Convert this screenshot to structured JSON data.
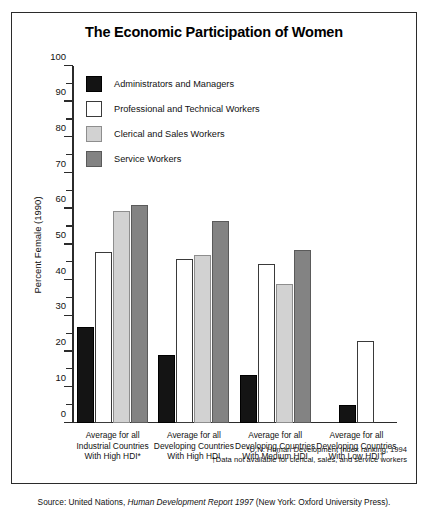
{
  "title": "The Economic Participation of Women",
  "legend": [
    {
      "label": "Administrators and Managers",
      "color": "#141414"
    },
    {
      "label": "Professional and Technical Workers",
      "color": "#ffffff"
    },
    {
      "label": "Clerical and Sales Workers",
      "color": "#d2d2d2"
    },
    {
      "label": "Service Workers",
      "color": "#838383"
    }
  ],
  "notes": {
    "asterisk": "*U.N. Human Development Index ranking, 1994",
    "dagger": "†Data not available for clerical, sales, and service workers"
  },
  "source": {
    "prefix": "Source: United Nations, ",
    "italic": "Human Development Report 1997",
    "suffix": " (New York: Oxford University Press)."
  },
  "chart_data": {
    "type": "bar",
    "title": "The Economic Participation of Women",
    "xlabel": "",
    "ylabel": "Percent Female (1990)",
    "ylim": [
      0,
      100
    ],
    "yticks": [
      0,
      10,
      20,
      30,
      40,
      50,
      60,
      70,
      80,
      90,
      100
    ],
    "ytick_labels": [
      "0",
      "10",
      "20",
      "30",
      "40",
      "50",
      "60",
      "70",
      "80",
      "90",
      "100"
    ],
    "minor_ticks": true,
    "grid": false,
    "legend_position": "upper-left-inside",
    "categories": [
      "Average for all\nIndustrial Countries\nWith High HDI*",
      "Average for all\nDeveloping Countries\nWith High HDI",
      "Average for all\nDeveloping Countries\nWith Medium HDI",
      "Average for all\nDeveloping Countries\nWith Low HDI†"
    ],
    "category_lines": [
      [
        "Average for all",
        "Industrial Countries",
        "With High HDI*"
      ],
      [
        "Average for all",
        "Developing Countries",
        "With High HDI"
      ],
      [
        "Average for all",
        "Developing Countries",
        "With Medium HDI"
      ],
      [
        "Average for all",
        "Developing Countries",
        "With Low HDI†"
      ]
    ],
    "series": [
      {
        "name": "Administrators and Managers",
        "color": "#141414",
        "values": [
          27,
          19,
          13.5,
          5
        ]
      },
      {
        "name": "Professional and Technical Workers",
        "color": "#ffffff",
        "values": [
          48,
          46,
          44.5,
          23
        ]
      },
      {
        "name": "Clerical and Sales Workers",
        "color": "#d2d2d2",
        "values": [
          59.5,
          47,
          39,
          null
        ]
      },
      {
        "name": "Service Workers",
        "color": "#838383",
        "values": [
          61,
          56.5,
          48.5,
          null
        ]
      }
    ]
  }
}
